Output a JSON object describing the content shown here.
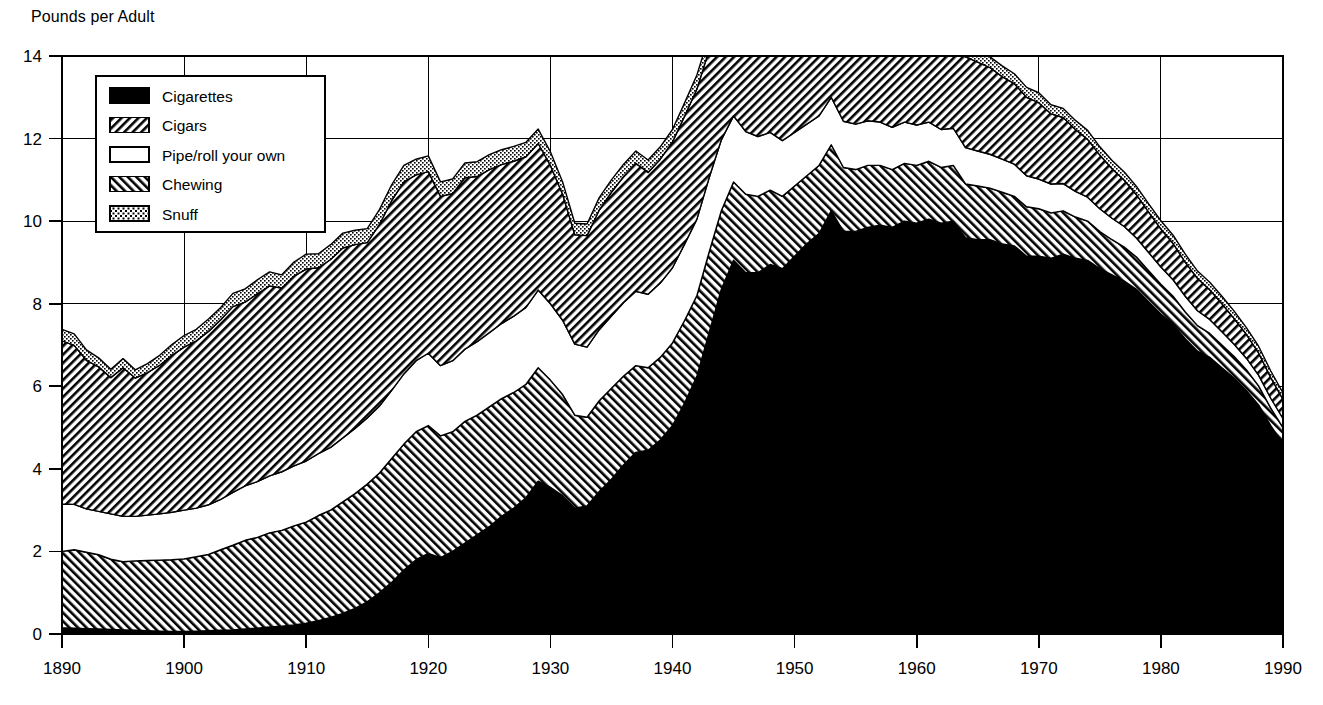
{
  "axis_title": "Pounds per Adult",
  "legend": {
    "items": [
      {
        "label": "Cigarettes",
        "key": "cigarettes",
        "swatch": "solid-black-swatch"
      },
      {
        "label": "Cigars",
        "key": "cigars",
        "swatch": "backslash-hatch-swatch"
      },
      {
        "label": "Pipe/roll your own",
        "key": "pipe",
        "swatch": "white-empty-swatch"
      },
      {
        "label": "Chewing",
        "key": "chewing",
        "swatch": "forwardslash-hatch-swatch"
      },
      {
        "label": "Snuff",
        "key": "snuff",
        "swatch": "stipple-dot-swatch"
      }
    ]
  },
  "chart_data": {
    "type": "area",
    "stacked": true,
    "title": "",
    "subtitle": "",
    "xlabel": "",
    "ylabel": "Pounds per Adult",
    "xlim": [
      1890,
      1990
    ],
    "ylim": [
      0,
      14
    ],
    "xticks": [
      1890,
      1900,
      1910,
      1920,
      1930,
      1940,
      1950,
      1960,
      1970,
      1980,
      1990
    ],
    "yticks": [
      0,
      2,
      4,
      6,
      8,
      10,
      12,
      14
    ],
    "xtick_labels": [
      "1890",
      "1900",
      "1910",
      "1920",
      "1930",
      "1940",
      "1950",
      "1960",
      "1970",
      "1980",
      "1990"
    ],
    "ytick_labels": [
      "0",
      "2",
      "4",
      "6",
      "8",
      "10",
      "12",
      "14"
    ],
    "grid": true,
    "grid_axis": "both",
    "legend_position": "upper-left-inside",
    "stack_order": [
      "cigarettes",
      "chewing",
      "pipe",
      "cigars",
      "snuff"
    ],
    "x": [
      1890,
      1891,
      1892,
      1893,
      1894,
      1895,
      1896,
      1897,
      1898,
      1899,
      1900,
      1901,
      1902,
      1903,
      1904,
      1905,
      1906,
      1907,
      1908,
      1909,
      1910,
      1911,
      1912,
      1913,
      1914,
      1915,
      1916,
      1917,
      1918,
      1919,
      1920,
      1921,
      1922,
      1923,
      1924,
      1925,
      1926,
      1927,
      1928,
      1929,
      1930,
      1931,
      1932,
      1933,
      1934,
      1935,
      1936,
      1937,
      1938,
      1939,
      1940,
      1941,
      1942,
      1943,
      1944,
      1945,
      1946,
      1947,
      1948,
      1949,
      1950,
      1951,
      1952,
      1953,
      1954,
      1955,
      1956,
      1957,
      1958,
      1959,
      1960,
      1961,
      1962,
      1963,
      1964,
      1965,
      1966,
      1967,
      1968,
      1969,
      1970,
      1971,
      1972,
      1973,
      1974,
      1975,
      1976,
      1977,
      1978,
      1979,
      1980,
      1981,
      1982,
      1983,
      1984,
      1985,
      1986,
      1987,
      1988,
      1989,
      1990
    ],
    "series": [
      {
        "name": "Cigarettes",
        "key": "cigarettes",
        "pattern": "solid-black",
        "values": [
          0.15,
          0.14,
          0.13,
          0.12,
          0.11,
          0.1,
          0.09,
          0.08,
          0.07,
          0.06,
          0.06,
          0.07,
          0.08,
          0.09,
          0.1,
          0.12,
          0.14,
          0.17,
          0.19,
          0.22,
          0.26,
          0.32,
          0.4,
          0.5,
          0.62,
          0.78,
          1.0,
          1.25,
          1.55,
          1.8,
          1.95,
          1.85,
          2.0,
          2.2,
          2.4,
          2.6,
          2.85,
          3.05,
          3.3,
          3.7,
          3.55,
          3.35,
          3.05,
          3.1,
          3.45,
          3.75,
          4.1,
          4.4,
          4.45,
          4.7,
          5.05,
          5.6,
          6.25,
          7.3,
          8.35,
          9.05,
          8.75,
          8.75,
          8.95,
          8.85,
          9.15,
          9.45,
          9.7,
          10.25,
          9.75,
          9.75,
          9.85,
          9.9,
          9.85,
          10.0,
          9.95,
          10.05,
          9.95,
          10.0,
          9.6,
          9.55,
          9.55,
          9.45,
          9.4,
          9.15,
          9.15,
          9.1,
          9.2,
          9.1,
          9.05,
          8.85,
          8.7,
          8.55,
          8.35,
          8.05,
          7.75,
          7.5,
          7.15,
          6.85,
          6.7,
          6.45,
          6.2,
          5.9,
          5.55,
          5.05,
          4.6
        ]
      },
      {
        "name": "Chewing",
        "key": "chewing",
        "pattern": "forwardslash-hatch",
        "values": [
          1.85,
          1.9,
          1.85,
          1.8,
          1.7,
          1.65,
          1.68,
          1.7,
          1.72,
          1.74,
          1.76,
          1.8,
          1.85,
          1.95,
          2.05,
          2.15,
          2.2,
          2.28,
          2.32,
          2.4,
          2.45,
          2.55,
          2.6,
          2.7,
          2.78,
          2.85,
          2.9,
          3.0,
          3.05,
          3.1,
          3.1,
          2.95,
          2.9,
          2.95,
          2.9,
          2.9,
          2.85,
          2.8,
          2.75,
          2.75,
          2.6,
          2.45,
          2.25,
          2.15,
          2.2,
          2.2,
          2.15,
          2.1,
          2.0,
          2.0,
          2.0,
          2.0,
          1.95,
          1.95,
          1.9,
          1.9,
          1.9,
          1.85,
          1.8,
          1.75,
          1.7,
          1.65,
          1.65,
          1.6,
          1.55,
          1.5,
          1.5,
          1.45,
          1.4,
          1.4,
          1.4,
          1.4,
          1.35,
          1.35,
          1.3,
          1.3,
          1.25,
          1.25,
          1.2,
          1.2,
          1.15,
          1.1,
          1.05,
          1.0,
          0.95,
          0.9,
          0.85,
          0.82,
          0.78,
          0.75,
          0.72,
          0.68,
          0.65,
          0.62,
          0.58,
          0.55,
          0.52,
          0.5,
          0.46,
          0.42,
          0.4
        ]
      },
      {
        "name": "Pipe/roll your own",
        "key": "pipe",
        "pattern": "white-empty",
        "values": [
          1.15,
          1.1,
          1.05,
          1.05,
          1.1,
          1.1,
          1.08,
          1.1,
          1.12,
          1.15,
          1.18,
          1.18,
          1.2,
          1.22,
          1.28,
          1.32,
          1.35,
          1.38,
          1.42,
          1.45,
          1.48,
          1.5,
          1.52,
          1.55,
          1.58,
          1.6,
          1.62,
          1.65,
          1.7,
          1.72,
          1.75,
          1.7,
          1.72,
          1.75,
          1.78,
          1.8,
          1.82,
          1.85,
          1.86,
          1.88,
          1.85,
          1.8,
          1.72,
          1.7,
          1.72,
          1.75,
          1.78,
          1.8,
          1.78,
          1.8,
          1.82,
          1.85,
          1.85,
          1.8,
          1.72,
          1.6,
          1.52,
          1.45,
          1.4,
          1.35,
          1.3,
          1.25,
          1.2,
          1.15,
          1.12,
          1.1,
          1.08,
          1.05,
          1.02,
          1.0,
          0.98,
          0.95,
          0.92,
          0.9,
          0.88,
          0.85,
          0.82,
          0.8,
          0.78,
          0.75,
          0.72,
          0.7,
          0.66,
          0.62,
          0.58,
          0.55,
          0.52,
          0.5,
          0.46,
          0.44,
          0.42,
          0.4,
          0.38,
          0.36,
          0.34,
          0.32,
          0.3,
          0.28,
          0.26,
          0.24,
          0.22
        ]
      },
      {
        "name": "Cigars",
        "key": "cigars",
        "pattern": "backslash-hatch",
        "values": [
          3.95,
          3.85,
          3.6,
          3.5,
          3.3,
          3.6,
          3.35,
          3.45,
          3.6,
          3.8,
          3.95,
          4.05,
          4.2,
          4.35,
          4.5,
          4.45,
          4.55,
          4.6,
          4.45,
          4.6,
          4.65,
          4.5,
          4.55,
          4.6,
          4.45,
          4.25,
          4.4,
          4.6,
          4.65,
          4.5,
          4.4,
          4.1,
          4.05,
          4.15,
          4.0,
          3.95,
          3.85,
          3.75,
          3.65,
          3.55,
          3.35,
          3.05,
          2.65,
          2.7,
          2.9,
          3.0,
          3.05,
          3.1,
          2.95,
          3.0,
          3.05,
          3.1,
          3.15,
          3.1,
          3.05,
          3.15,
          2.5,
          2.35,
          2.3,
          2.25,
          2.2,
          2.15,
          2.1,
          2.05,
          2.0,
          2.0,
          2.05,
          2.0,
          1.98,
          2.0,
          2.05,
          2.1,
          2.15,
          2.2,
          2.2,
          2.15,
          2.1,
          2.0,
          1.95,
          1.9,
          1.85,
          1.7,
          1.6,
          1.5,
          1.4,
          1.3,
          1.2,
          1.12,
          1.05,
          0.98,
          0.92,
          0.88,
          0.82,
          0.78,
          0.72,
          0.68,
          0.62,
          0.58,
          0.54,
          0.5,
          0.46
        ]
      },
      {
        "name": "Snuff",
        "key": "snuff",
        "pattern": "stipple-dot",
        "values": [
          0.28,
          0.28,
          0.25,
          0.22,
          0.2,
          0.22,
          0.2,
          0.22,
          0.24,
          0.26,
          0.28,
          0.28,
          0.3,
          0.3,
          0.32,
          0.32,
          0.34,
          0.34,
          0.32,
          0.34,
          0.36,
          0.34,
          0.36,
          0.36,
          0.35,
          0.34,
          0.36,
          0.38,
          0.4,
          0.38,
          0.38,
          0.35,
          0.35,
          0.36,
          0.36,
          0.36,
          0.36,
          0.36,
          0.35,
          0.35,
          0.33,
          0.3,
          0.28,
          0.28,
          0.3,
          0.3,
          0.3,
          0.3,
          0.3,
          0.3,
          0.3,
          0.32,
          0.34,
          0.35,
          0.35,
          0.36,
          0.32,
          0.3,
          0.3,
          0.3,
          0.3,
          0.3,
          0.3,
          0.3,
          0.3,
          0.3,
          0.3,
          0.3,
          0.28,
          0.28,
          0.28,
          0.28,
          0.28,
          0.28,
          0.26,
          0.26,
          0.26,
          0.26,
          0.24,
          0.24,
          0.24,
          0.22,
          0.22,
          0.22,
          0.22,
          0.2,
          0.2,
          0.2,
          0.2,
          0.2,
          0.2,
          0.2,
          0.2,
          0.18,
          0.18,
          0.18,
          0.18,
          0.16,
          0.16,
          0.16,
          0.16
        ]
      }
    ]
  }
}
